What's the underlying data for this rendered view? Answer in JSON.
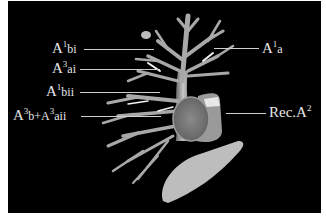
{
  "figure": {
    "background": "#000000",
    "frame_color": "#ffffff",
    "label_color": "#e6e6e6",
    "labels": [
      {
        "id": "a1bi",
        "base": "A",
        "sup": "1",
        "sub": "bi",
        "side": "left"
      },
      {
        "id": "a3ai",
        "base": "A",
        "sup": "3",
        "sub": "ai",
        "side": "left"
      },
      {
        "id": "a1bii",
        "base": "A",
        "sup": "1",
        "sub": "bii",
        "side": "left"
      },
      {
        "id": "a3b_a3aii",
        "base": "A",
        "sup": "3",
        "sub": "b+A",
        "sup2": "3",
        "sub2": "aii",
        "side": "left"
      },
      {
        "id": "a1a",
        "base": "A",
        "sup": "1",
        "sub": "a",
        "side": "right"
      },
      {
        "id": "reca2",
        "base": "Rec.A",
        "sup": "2",
        "sub": "",
        "side": "right"
      }
    ]
  }
}
